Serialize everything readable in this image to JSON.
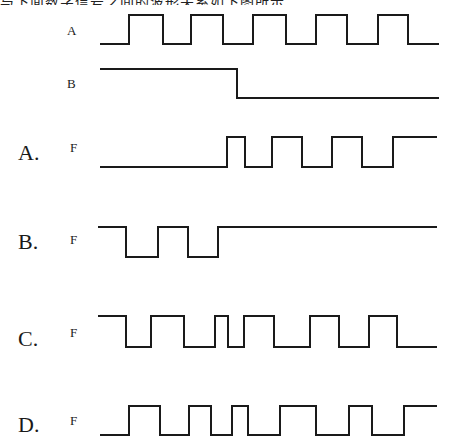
{
  "top_text": "与下面数字信号之间的波形关系如下图所示",
  "inputs": {
    "A": {
      "label": "A",
      "points": "100,44 129,44 129,15 163,15 163,44 191,44 191,15 223,15 223,44 253,44 253,15 286,15 286,44 316,44 316,15 347,15 347,44 378,44 378,15 408,15 408,44 439,44"
    },
    "B": {
      "label": "B",
      "points": "100,69 237,69 237,98 439,98"
    }
  },
  "options": [
    {
      "letter": "A.",
      "signal": "F",
      "points": "100,167 227,167 227,137 245,137 245,167 272,167 272,137 302,137 302,167 332,167 332,137 362,137 362,167 393,167 393,137 437,137"
    },
    {
      "letter": "B.",
      "signal": "F",
      "points": "98,227 126,227 126,257 158,257 158,227 188,227 188,257 218,257 218,227 437,227"
    },
    {
      "letter": "C.",
      "signal": "F",
      "points": "98,316 126,316 126,347 151,347 151,316 184,316 184,347 215,347 215,316 228,316 228,347 244,347 244,316 274,316 274,347 310,347 310,316 339,316 339,347 369,347 369,316 397,316 397,347 437,347"
    },
    {
      "letter": "D.",
      "signal": "F",
      "points": "100,435 129,435 129,406 160,406 160,435 189,435 189,406 211,406 211,435 232,435 232,406 248,406 248,435 280,435 280,406 316,406 316,435 349,435 349,406 372,406 372,435 404,435 404,406 437,406"
    }
  ]
}
